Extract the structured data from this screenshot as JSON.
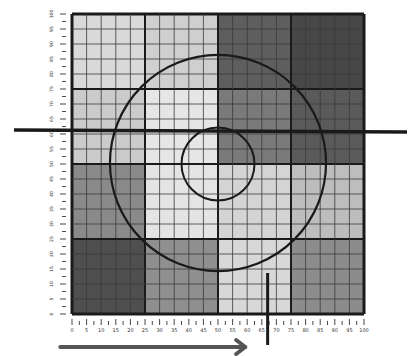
{
  "diagram": {
    "type": "grid-target-diagram",
    "grid": {
      "x_range": [
        0,
        100
      ],
      "y_range": [
        0,
        100
      ],
      "cells": 20,
      "block_size_cells": 5,
      "block_shades": [
        [
          "#d9d9d9",
          "#cfcfcf",
          "#5e5e5e",
          "#474747"
        ],
        [
          "#cbcbcb",
          "#e6e6e6",
          "#7a7a7a",
          "#5a5a5a"
        ],
        [
          "#8a8a8a",
          "#e4e4e4",
          "#d4d4d4",
          "#bdbdbd"
        ],
        [
          "#4f4f4f",
          "#8f8f8f",
          "#d8d8d8",
          "#8c8c8c"
        ]
      ],
      "cell_line_color": "#3a3a3a",
      "block_line_color": "#1a1a1a"
    },
    "x_axis": {
      "ticks": [
        "0",
        "5",
        "10",
        "15",
        "20",
        "25",
        "30",
        "35",
        "40",
        "45",
        "50",
        "55",
        "60",
        "65",
        "70",
        "75",
        "80",
        "85",
        "90",
        "95",
        "100"
      ]
    },
    "y_axis": {
      "ticks": [
        "0",
        "5",
        "10",
        "15",
        "20",
        "25",
        "30",
        "35",
        "40",
        "45",
        "50",
        "55",
        "60",
        "65",
        "70",
        "75",
        "80",
        "85",
        "90",
        "95",
        "100"
      ]
    },
    "overlays": {
      "large_circle": {
        "cx": 50,
        "cy": 50,
        "r": 37
      },
      "small_circle": {
        "cx": 50,
        "cy": 50,
        "r": 12.5
      },
      "horizontal_line_y": 61,
      "vertical_marker_x": 67,
      "arrow": {
        "from_x": -4,
        "to_x": 60,
        "label": "direction"
      }
    }
  }
}
